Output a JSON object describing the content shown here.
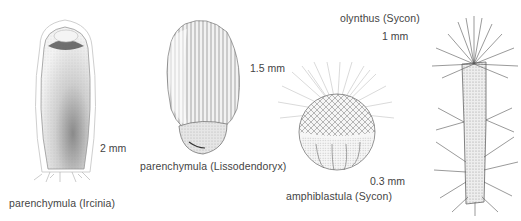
{
  "figures": [
    {
      "id": "irciniae",
      "name": "parenchymula (Ircinia)",
      "scale": "2 mm"
    },
    {
      "id": "lissodendoryx",
      "name": "parenchymula (Lissodendoryx)",
      "scale": "1.5 mm"
    },
    {
      "id": "sycon-amphiblastula",
      "name": "amphiblastula (Sycon)",
      "scale": "0.3 mm"
    },
    {
      "id": "sycon-olynthus",
      "name": "olynthus (Sycon)",
      "scale": "1 mm"
    }
  ],
  "colors": {
    "background": "#ffffff",
    "ink": "#3a3a3a",
    "stipple_dark": "#555555",
    "stipple_light": "#bdbdbd"
  }
}
